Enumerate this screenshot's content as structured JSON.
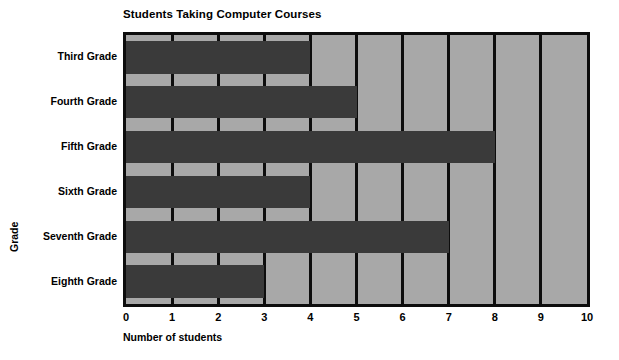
{
  "chart_data": {
    "type": "bar",
    "orientation": "horizontal",
    "title": "Students Taking Computer Courses",
    "xlabel": "Number of students",
    "ylabel": "Grade",
    "categories": [
      "Third Grade",
      "Fourth Grade",
      "Fifth Grade",
      "Sixth Grade",
      "Seventh Grade",
      "Eighth Grade"
    ],
    "values": [
      4,
      5,
      8,
      4,
      7,
      3
    ],
    "xlim": [
      0,
      10
    ],
    "xticks": [
      "0",
      "1",
      "2",
      "3",
      "4",
      "5",
      "6",
      "7",
      "8",
      "9",
      "10"
    ],
    "grid": "vertical",
    "legend": "none",
    "colors": {
      "bar": "#3a3a3a",
      "plot_background": "#a8a8a8",
      "axis": "#0d0d0d",
      "page_background": "#ffffff",
      "text": "#000000"
    }
  }
}
